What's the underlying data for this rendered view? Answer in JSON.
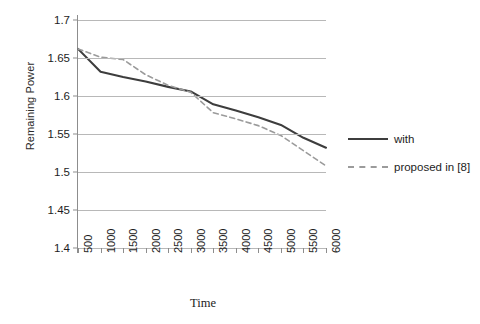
{
  "chart_data": {
    "type": "line",
    "title": "",
    "xlabel": "Time",
    "ylabel": "Remaining Power",
    "x": [
      500,
      1000,
      1500,
      2000,
      2500,
      3000,
      3500,
      4000,
      4500,
      5000,
      5500,
      6000
    ],
    "xtick_labels": [
      "500",
      "1000",
      "1500",
      "2000",
      "2500",
      "3000",
      "3500",
      "4000",
      "4500",
      "5000",
      "5500",
      "6000"
    ],
    "ytick_labels": [
      "1.7",
      "1.65",
      "1.6",
      "1.55",
      "1.5",
      "1.45",
      "1.4"
    ],
    "ytick_values": [
      1.7,
      1.65,
      1.6,
      1.55,
      1.5,
      1.45,
      1.4
    ],
    "ylim": [
      1.4,
      1.7
    ],
    "xlim": [
      500,
      6000
    ],
    "grid": "horizontal",
    "legend_position": "right",
    "series": [
      {
        "name": "with",
        "style": "solid",
        "color": "#3d3d3d",
        "values": [
          1.662,
          1.632,
          1.625,
          1.619,
          1.612,
          1.606,
          1.589,
          1.581,
          1.572,
          1.562,
          1.545,
          1.532
        ]
      },
      {
        "name": "proposed in [8]",
        "style": "dashed",
        "color": "#9b9b9b",
        "values": [
          1.662,
          1.651,
          1.648,
          1.628,
          1.614,
          1.605,
          1.578,
          1.57,
          1.561,
          1.548,
          1.528,
          1.508
        ]
      }
    ]
  },
  "legend": {
    "items": [
      {
        "label": "with"
      },
      {
        "label": "proposed in [8]"
      }
    ]
  },
  "axes": {
    "y_title": "Remaining Power",
    "x_title": "Time"
  },
  "colors": {
    "grid": "#b8b8b8",
    "axis": "#8d8d8d",
    "series_solid": "#3d3d3d",
    "series_dashed": "#9b9b9b",
    "text": "#1d1d1d",
    "background": "#ffffff"
  }
}
